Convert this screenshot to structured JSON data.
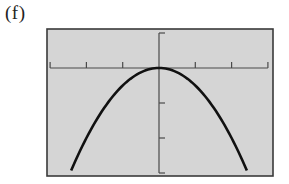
{
  "panel": {
    "label": "(f)"
  },
  "colors": {
    "page_background": "#ffffff",
    "plot_background": "#d5d5d5",
    "frame": "#3a3a3a",
    "axes": "#4a4a4a",
    "curve": "#111111"
  },
  "chart_data": {
    "type": "line",
    "title": "",
    "xlabel": "",
    "ylabel": "",
    "function": "y = -x^2 / 2",
    "xlim": [
      -3,
      3
    ],
    "ylim": [
      -3,
      1
    ],
    "x_ticks": [
      -3,
      -2,
      -1,
      0,
      1,
      2,
      3
    ],
    "y_ticks": [
      1,
      0,
      -1,
      -2,
      -3
    ],
    "tick_labels_shown": false,
    "grid": false,
    "legend": null,
    "series": [
      {
        "name": "parabola",
        "x": [
          -2.42,
          -2.0,
          -1.5,
          -1.0,
          -0.5,
          0,
          0.5,
          1.0,
          1.5,
          2.0,
          2.42
        ],
        "y": [
          -2.93,
          -2.0,
          -1.125,
          -0.5,
          -0.125,
          0,
          -0.125,
          -0.5,
          -1.125,
          -2.0,
          -2.93
        ]
      }
    ],
    "vertex": [
      0,
      0
    ],
    "annotations": []
  },
  "layout": {
    "frame": {
      "x": 47,
      "y": 29,
      "width": 226,
      "height": 147
    },
    "origin_px": [
      159,
      68
    ],
    "x_unit_px": 36.3,
    "y_unit_px": 35,
    "tick_length_px": 6
  }
}
